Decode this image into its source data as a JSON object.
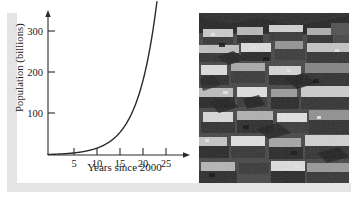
{
  "figure": {
    "kind": "textbook-figure",
    "ink_color": "#2b2b2b",
    "shadow_color": "#e4e4e4",
    "photo": {
      "alt_name": "aerial-photo-dense-housing",
      "description": "Grayscale aerial photograph of densely packed hillside housing",
      "tone": "grayscale"
    }
  },
  "chart_data": {
    "type": "line",
    "title": "",
    "xlabel": "Years since 2000",
    "ylabel": "Population (billions)",
    "xlim": [
      0,
      27.5
    ],
    "ylim": [
      0,
      345
    ],
    "xticks": [
      5,
      10,
      15,
      20,
      25
    ],
    "xtick_labels": [
      "5",
      "10",
      "15",
      "20",
      "25"
    ],
    "yticks": [
      100,
      200,
      300
    ],
    "ytick_labels": [
      "100",
      "200",
      "300"
    ],
    "grid": false,
    "legend": null,
    "axis_arrows": true,
    "series": [
      {
        "name": "Population",
        "curve": "exponential",
        "x": [
          0,
          2,
          4,
          6,
          8,
          10,
          12,
          14,
          16,
          18,
          20,
          22,
          24,
          26
        ],
        "y": [
          1.3,
          2.1,
          3.4,
          5.5,
          8.8,
          14.2,
          22.8,
          36.7,
          59.0,
          94.9,
          152.6,
          245.4,
          394.6,
          634.6
        ]
      }
    ]
  }
}
